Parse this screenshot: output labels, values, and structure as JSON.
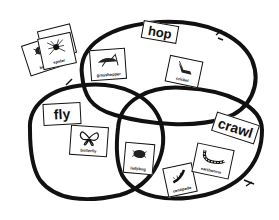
{
  "diagram": {
    "type": "venn",
    "sets": [
      {
        "id": "hop",
        "label": "hop"
      },
      {
        "id": "fly",
        "label": "fly"
      },
      {
        "id": "crawl",
        "label": "crawl"
      }
    ],
    "outside_cards": [
      {
        "label": "beetle",
        "icon": "beetle-icon"
      },
      {
        "label": "spider",
        "icon": "spider-icon"
      }
    ],
    "cards": {
      "grasshopper": {
        "label": "grasshopper",
        "sets": [
          "hop"
        ]
      },
      "cricket": {
        "label": "cricket",
        "sets": [
          "hop"
        ]
      },
      "butterfly": {
        "label": "butterfly",
        "sets": [
          "fly"
        ]
      },
      "ladybug": {
        "label": "ladybug",
        "sets": [
          "fly",
          "crawl"
        ]
      },
      "centipede": {
        "label": "centipede",
        "sets": [
          "crawl"
        ]
      },
      "earthworm": {
        "label": "earthworm",
        "sets": [
          "crawl"
        ]
      }
    },
    "outline_color": "#111111",
    "background_color": "#ffffff"
  }
}
